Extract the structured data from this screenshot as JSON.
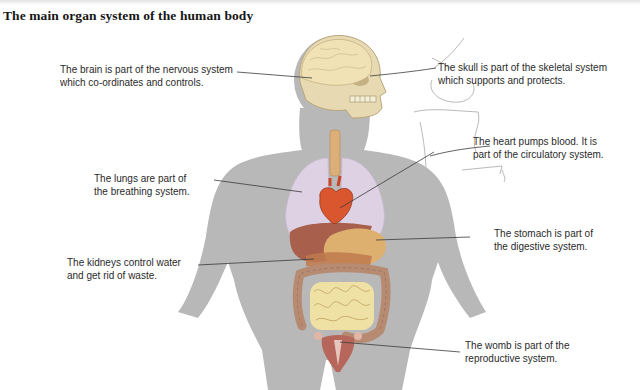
{
  "title": "The main organ system of the human body",
  "labels": [
    {
      "id": "brain",
      "line1": "The brain is part of the nervous system",
      "line2": "which co-ordinates and controls.",
      "organ": "brain",
      "system": "nervous system"
    },
    {
      "id": "skull",
      "line1": "The skull is part of the skeletal system",
      "line2": "which supports and protects.",
      "organ": "skull",
      "system": "skeletal system"
    },
    {
      "id": "heart",
      "line1": "The heart pumps blood. It is",
      "line2": "part of the circulatory system.",
      "organ": "heart",
      "system": "circulatory system"
    },
    {
      "id": "lungs",
      "line1": "The lungs are part of",
      "line2": "the breathing system.",
      "organ": "lungs",
      "system": "breathing system"
    },
    {
      "id": "stomach",
      "line1": "The stomach is part of",
      "line2": "the digestive system.",
      "organ": "stomach",
      "system": "digestive system"
    },
    {
      "id": "kidneys",
      "line1": "The kidneys control water",
      "line2": "and get rid of waste.",
      "organ": "kidneys",
      "system": "excretory system"
    },
    {
      "id": "womb",
      "line1": "The womb is part of the",
      "line2": "reproductive system.",
      "organ": "womb",
      "system": "reproductive system"
    }
  ],
  "colors": {
    "body": "#b7b7b7",
    "brain": "#efe0b0",
    "skull": "#e6d8ae",
    "lungs": "#dcd0e2",
    "heart": "#d9552e",
    "liver": "#a65a48",
    "stomach": "#dcae6c",
    "intestine_large": "#b88c72",
    "intestine_small": "#efe0a2",
    "womb": "#b5645a",
    "trachea": "#d9a870",
    "leader_line": "#3a3a3a"
  }
}
